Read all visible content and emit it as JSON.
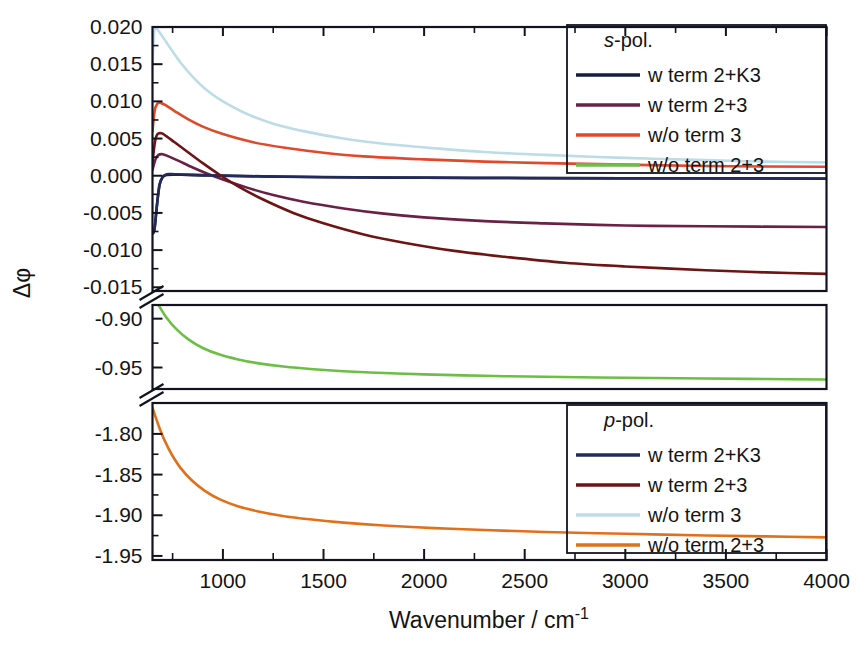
{
  "chart_data": {
    "type": "line",
    "title": "",
    "xlabel": "Wavenumber / cm-1",
    "xlabel_base": "Wavenumber / cm",
    "xlabel_sup": "-1",
    "ylabel": "Δφ",
    "xlim": [
      650,
      4000
    ],
    "xticks": [
      1000,
      1500,
      2000,
      2500,
      3000,
      3500,
      4000
    ],
    "xtick_labels": [
      "1000",
      "1500",
      "2000",
      "2500",
      "3000",
      "3500",
      "4000"
    ],
    "x_minor_step": 250,
    "grid": false,
    "broken_axis": true,
    "y_segments": [
      {
        "name": "upper",
        "range": [
          -0.0155,
          0.02
        ],
        "ticks": [
          0.02,
          0.015,
          0.01,
          0.005,
          0.0,
          -0.005,
          -0.01,
          -0.015
        ],
        "tick_labels": [
          "0.020",
          "0.015",
          "0.010",
          "0.005",
          "0.000",
          "-0.005",
          "-0.010",
          "-0.015"
        ]
      },
      {
        "name": "middle",
        "range": [
          -0.972,
          -0.886
        ],
        "ticks": [
          -0.9,
          -0.95
        ],
        "tick_labels": [
          "-0.90",
          "-0.95"
        ]
      },
      {
        "name": "lower",
        "range": [
          -1.955,
          -1.762
        ],
        "ticks": [
          -1.8,
          -1.85,
          -1.9,
          -1.95
        ],
        "tick_labels": [
          "-1.80",
          "-1.85",
          "-1.90",
          "-1.95"
        ]
      }
    ],
    "legends": [
      {
        "name": "s-pol",
        "title_italic": "s",
        "title_rest": "-pol.",
        "position": "upper-right",
        "entries": [
          {
            "label": "w term 2+K3",
            "color": "#151c3d"
          },
          {
            "label": "w term 2+3",
            "color": "#6b2046"
          },
          {
            "label": "w/o term 3",
            "color": "#e04a2a"
          },
          {
            "label": "w/o term 2+3",
            "color": "#6cbe45"
          }
        ]
      },
      {
        "name": "p-pol",
        "title_italic": "p",
        "title_rest": "-pol.",
        "position": "lower-right",
        "entries": [
          {
            "label": "w term 2+K3",
            "color": "#232a5c"
          },
          {
            "label": "w term 2+3",
            "color": "#6e1414"
          },
          {
            "label": "w/o term 3",
            "color": "#bcdce8"
          },
          {
            "label": "w/o term 2+3",
            "color": "#e2701a"
          }
        ]
      }
    ],
    "series": [
      {
        "name": "s-pol w term 2+K3",
        "legend": "s-pol",
        "label": "w term 2+K3",
        "color": "#151c3d",
        "panel": "upper",
        "points": [
          [
            650,
            -0.0078
          ],
          [
            660,
            -0.0072
          ],
          [
            672,
            -0.004
          ],
          [
            685,
            -0.0012
          ],
          [
            700,
            -0.0002
          ],
          [
            720,
            0.0001
          ],
          [
            760,
            0.00015
          ],
          [
            820,
            0.0001
          ],
          [
            900,
            5e-05
          ],
          [
            1000,
            0.0
          ],
          [
            1200,
            -0.0001
          ],
          [
            1500,
            -0.0002
          ],
          [
            2000,
            -0.00028
          ],
          [
            2500,
            -0.00032
          ],
          [
            3000,
            -0.00035
          ],
          [
            3500,
            -0.00037
          ],
          [
            4000,
            -0.0004
          ]
        ]
      },
      {
        "name": "s-pol w term 2+3",
        "legend": "s-pol",
        "label": "w term 2+3",
        "color": "#6b2046",
        "panel": "upper",
        "points": [
          [
            650,
            0.0008
          ],
          [
            665,
            0.0022
          ],
          [
            680,
            0.0028
          ],
          [
            700,
            0.0029
          ],
          [
            730,
            0.0026
          ],
          [
            780,
            0.002
          ],
          [
            850,
            0.0011
          ],
          [
            920,
            0.0003
          ],
          [
            1000,
            -0.0005
          ],
          [
            1120,
            -0.0016
          ],
          [
            1250,
            -0.0026
          ],
          [
            1400,
            -0.0035
          ],
          [
            1600,
            -0.0044
          ],
          [
            1800,
            -0.0051
          ],
          [
            2000,
            -0.0056
          ],
          [
            2300,
            -0.0061
          ],
          [
            2600,
            -0.0064
          ],
          [
            3000,
            -0.0067
          ],
          [
            3400,
            -0.0068
          ],
          [
            4000,
            -0.0069
          ]
        ]
      },
      {
        "name": "s-pol w/o term 3",
        "legend": "s-pol",
        "label": "w/o term 3",
        "color": "#e04a2a",
        "panel": "upper",
        "points": [
          [
            650,
            0.006
          ],
          [
            660,
            0.0086
          ],
          [
            672,
            0.0096
          ],
          [
            690,
            0.0098
          ],
          [
            720,
            0.0094
          ],
          [
            760,
            0.0087
          ],
          [
            820,
            0.0077
          ],
          [
            900,
            0.0066
          ],
          [
            1000,
            0.0056
          ],
          [
            1150,
            0.0045
          ],
          [
            1300,
            0.0038
          ],
          [
            1500,
            0.0031
          ],
          [
            1700,
            0.0026
          ],
          [
            2000,
            0.0022
          ],
          [
            2300,
            0.0019
          ],
          [
            2600,
            0.0017
          ],
          [
            3000,
            0.0015
          ],
          [
            3400,
            0.0013
          ],
          [
            4000,
            0.0012
          ]
        ]
      },
      {
        "name": "p-pol w term 2+K3",
        "legend": "p-pol",
        "label": "w term 2+K3",
        "color": "#232a5c",
        "panel": "upper",
        "points": [
          [
            650,
            -0.0078
          ],
          [
            660,
            -0.0072
          ],
          [
            672,
            -0.004
          ],
          [
            685,
            -0.0012
          ],
          [
            700,
            -0.0002
          ],
          [
            720,
            0.0002
          ],
          [
            760,
            0.0002
          ],
          [
            820,
            0.00015
          ],
          [
            900,
            8e-05
          ],
          [
            1000,
            2e-05
          ],
          [
            1200,
            -8e-05
          ],
          [
            1500,
            -0.00018
          ],
          [
            2000,
            -0.00026
          ],
          [
            2500,
            -0.0003
          ],
          [
            3000,
            -0.00033
          ],
          [
            3500,
            -0.00035
          ],
          [
            4000,
            -0.00038
          ]
        ]
      },
      {
        "name": "p-pol w term 2+3",
        "legend": "p-pol",
        "label": "w term 2+3",
        "color": "#6e1414",
        "panel": "upper",
        "points": [
          [
            650,
            0.0018
          ],
          [
            662,
            0.0045
          ],
          [
            675,
            0.0056
          ],
          [
            695,
            0.0057
          ],
          [
            720,
            0.0053
          ],
          [
            760,
            0.0045
          ],
          [
            820,
            0.0033
          ],
          [
            900,
            0.0017
          ],
          [
            980,
            0.0002
          ],
          [
            1080,
            -0.0015
          ],
          [
            1200,
            -0.0032
          ],
          [
            1350,
            -0.005
          ],
          [
            1500,
            -0.0064
          ],
          [
            1700,
            -0.0079
          ],
          [
            1900,
            -0.009
          ],
          [
            2150,
            -0.0101
          ],
          [
            2400,
            -0.0109
          ],
          [
            2700,
            -0.0117
          ],
          [
            3000,
            -0.0122
          ],
          [
            3400,
            -0.0127
          ],
          [
            3700,
            -0.013
          ],
          [
            4000,
            -0.0132
          ]
        ]
      },
      {
        "name": "p-pol w/o term 3",
        "legend": "p-pol",
        "label": "w/o term 3",
        "color": "#bcdce8",
        "panel": "upper",
        "points": [
          [
            650,
            0.015
          ],
          [
            658,
            0.0192
          ],
          [
            668,
            0.0198
          ],
          [
            685,
            0.0193
          ],
          [
            710,
            0.0183
          ],
          [
            745,
            0.0169
          ],
          [
            790,
            0.0152
          ],
          [
            850,
            0.0133
          ],
          [
            920,
            0.0115
          ],
          [
            1000,
            0.01
          ],
          [
            1120,
            0.0083
          ],
          [
            1250,
            0.007
          ],
          [
            1400,
            0.006
          ],
          [
            1600,
            0.005
          ],
          [
            1800,
            0.0043
          ],
          [
            2050,
            0.0037
          ],
          [
            2300,
            0.0032
          ],
          [
            2600,
            0.0028
          ],
          [
            3000,
            0.0024
          ],
          [
            3400,
            0.0021
          ],
          [
            3700,
            0.0019
          ],
          [
            4000,
            0.0018
          ]
        ]
      },
      {
        "name": "s-pol w/o term 2+3",
        "legend": "s-pol",
        "label": "w/o term 2+3",
        "color": "#6cbe45",
        "panel": "middle",
        "points": [
          [
            650,
            -0.8755
          ],
          [
            680,
            -0.886
          ],
          [
            720,
            -0.899
          ],
          [
            770,
            -0.911
          ],
          [
            830,
            -0.9215
          ],
          [
            900,
            -0.93
          ],
          [
            980,
            -0.9365
          ],
          [
            1070,
            -0.9415
          ],
          [
            1170,
            -0.9455
          ],
          [
            1300,
            -0.949
          ],
          [
            1450,
            -0.9518
          ],
          [
            1600,
            -0.9538
          ],
          [
            1800,
            -0.9556
          ],
          [
            2000,
            -0.957
          ],
          [
            2300,
            -0.9585
          ],
          [
            2600,
            -0.9595
          ],
          [
            3000,
            -0.9605
          ],
          [
            3400,
            -0.9613
          ],
          [
            3700,
            -0.9618
          ],
          [
            4000,
            -0.9622
          ]
        ]
      },
      {
        "name": "p-pol w/o term 2+3",
        "legend": "p-pol",
        "label": "w/o term 2+3",
        "color": "#e2701a",
        "panel": "lower",
        "points": [
          [
            650,
            -1.768
          ],
          [
            665,
            -1.779
          ],
          [
            685,
            -1.793
          ],
          [
            710,
            -1.808
          ],
          [
            745,
            -1.825
          ],
          [
            790,
            -1.842
          ],
          [
            845,
            -1.857
          ],
          [
            910,
            -1.87
          ],
          [
            985,
            -1.8805
          ],
          [
            1070,
            -1.8885
          ],
          [
            1170,
            -1.895
          ],
          [
            1290,
            -1.9005
          ],
          [
            1430,
            -1.905
          ],
          [
            1600,
            -1.909
          ],
          [
            1800,
            -1.9125
          ],
          [
            2050,
            -1.9158
          ],
          [
            2300,
            -1.9182
          ],
          [
            2600,
            -1.9205
          ],
          [
            3000,
            -1.9228
          ],
          [
            3400,
            -1.9248
          ],
          [
            3700,
            -1.926
          ],
          [
            4000,
            -1.9272
          ]
        ]
      }
    ]
  }
}
